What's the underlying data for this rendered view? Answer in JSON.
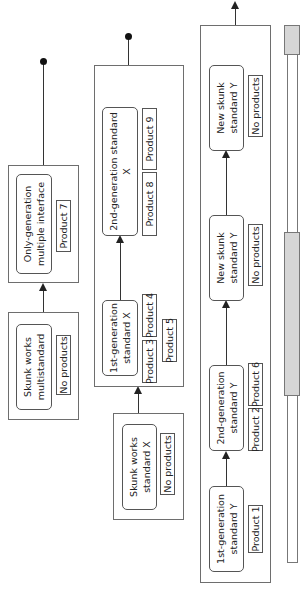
{
  "orientation": "rotated-90-ccw",
  "colors": {
    "line": "#333333",
    "box_border": "#6e6e6e",
    "timeline_fill": "#d6d6d6"
  },
  "rows": {
    "multistandard": {
      "skunk_box": {
        "title": "Skunk works multistandard",
        "products": [
          "No products"
        ]
      },
      "only_box": {
        "title": "Only-generation multiple interface",
        "products": [
          "Product 7"
        ]
      },
      "end": "dot"
    },
    "standard_x": {
      "skunk_box": {
        "title": "Skunk works standard X",
        "products": [
          "No products"
        ]
      },
      "gen1_box": {
        "title": "1st-generation standard X",
        "products": [
          "Product 3",
          "Product 4",
          "Product 5"
        ]
      },
      "gen2_box": {
        "title": "2nd-generation standard X",
        "products": [
          "Product 8",
          "Product 9"
        ]
      },
      "end": "dot"
    },
    "standard_y": {
      "gen1_box": {
        "title": "1st-generation standard Y",
        "products": [
          "Product 1"
        ]
      },
      "gen2_box": {
        "title": "2nd-generation standard Y",
        "products": [
          "Product 2",
          "Product 6"
        ]
      },
      "skunk1_box": {
        "title": "New skunk standard Y",
        "products": [
          "No products"
        ]
      },
      "skunk2_box": {
        "title": "New skunk standard Y",
        "products": [
          "No products"
        ]
      },
      "end": "arrow"
    }
  },
  "timeline": {
    "segments": [
      {
        "label": "period-1",
        "filled": false
      },
      {
        "label": "period-2",
        "filled": true
      },
      {
        "label": "period-3",
        "filled": false
      },
      {
        "label": "period-4",
        "filled": true
      }
    ]
  }
}
